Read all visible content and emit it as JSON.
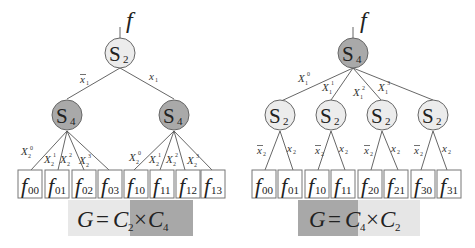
{
  "left_diagram": {
    "root": {
      "label": "S",
      "sub": "2",
      "output": "f"
    },
    "root_edges": [
      {
        "label": "x",
        "sub": "1",
        "bar": true
      },
      {
        "label": "x",
        "sub": "1",
        "bar": false
      }
    ],
    "children": [
      {
        "label": "S",
        "sub": "4"
      },
      {
        "label": "S",
        "sub": "4"
      }
    ],
    "child_edge_labels": [
      [
        {
          "label": "X",
          "sub": "2",
          "sup": "0"
        },
        {
          "label": "X",
          "sub": "2",
          "sup": "1"
        },
        {
          "label": "X",
          "sub": "2",
          "sup": "2"
        },
        {
          "label": "X",
          "sub": "2",
          "sup": "3"
        }
      ],
      [
        {
          "label": "X",
          "sub": "2",
          "sup": "0"
        },
        {
          "label": "X",
          "sub": "2",
          "sup": "1"
        },
        {
          "label": "X",
          "sub": "2",
          "sup": "2"
        },
        {
          "label": "X",
          "sub": "2",
          "sup": "3"
        }
      ]
    ],
    "leaves": [
      "00",
      "01",
      "02",
      "03",
      "10",
      "11",
      "12",
      "13"
    ],
    "equation": {
      "G": "G",
      "eq": "=",
      "c1": "C",
      "c1_sub": "2",
      "times": "×",
      "c2": "C",
      "c2_sub": "4"
    }
  },
  "right_diagram": {
    "root": {
      "label": "S",
      "sub": "4",
      "output": "f"
    },
    "root_edges": [
      {
        "label": "X",
        "sub": "1",
        "sup": "0"
      },
      {
        "label": "X",
        "sub": "1",
        "sup": "1"
      },
      {
        "label": "X",
        "sub": "1",
        "sup": "2"
      },
      {
        "label": "X",
        "sub": "1",
        "sup": "3"
      }
    ],
    "children": [
      {
        "label": "S",
        "sub": "2"
      },
      {
        "label": "S",
        "sub": "2"
      },
      {
        "label": "S",
        "sub": "2"
      },
      {
        "label": "S",
        "sub": "2"
      }
    ],
    "child_edge_labels": [
      {
        "label": "x",
        "sub": "2",
        "bar": true
      },
      {
        "label": "x",
        "sub": "2",
        "bar": false
      }
    ],
    "leaves": [
      "00",
      "01",
      "10",
      "11",
      "20",
      "21",
      "30",
      "31"
    ],
    "equation": {
      "G": "G",
      "eq": "=",
      "c1": "C",
      "c1_sub": "4",
      "times": "×",
      "c2": "C",
      "c2_sub": "2"
    }
  },
  "colors": {
    "light_node": "#ececec",
    "dark_node": "#a9a9a9",
    "light_band": "#e6e6e6",
    "dark_band": "#a8a8a8"
  }
}
